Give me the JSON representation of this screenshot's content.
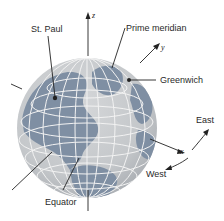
{
  "diagram": {
    "type": "globe-coordinate-system",
    "labels": {
      "st_paul": "St. Paul",
      "prime_meridian": "Prime meridian",
      "greenwich": "Greenwich",
      "equator": "Equator",
      "east": "East",
      "west": "West"
    },
    "axes": {
      "z": "z",
      "y": "y",
      "x": "x"
    },
    "colors": {
      "ocean": "#c9ccce",
      "land": "#7f8fa3",
      "grid": "#f2f2f2",
      "ink": "#222222"
    }
  }
}
